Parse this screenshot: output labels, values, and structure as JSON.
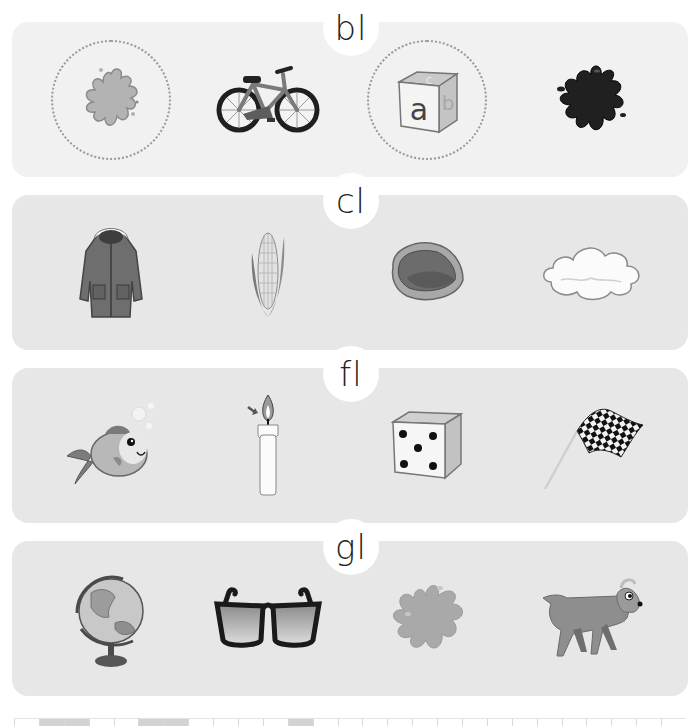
{
  "worksheet": {
    "rows": [
      {
        "blend": "bl",
        "pictures": [
          {
            "name": "blob-splat",
            "icon": "splat-icon",
            "circled": true
          },
          {
            "name": "bike",
            "icon": "bicycle-icon",
            "circled": false
          },
          {
            "name": "block",
            "icon": "letter-block-icon",
            "circled": true,
            "block_letters": [
              "a",
              "b",
              "c"
            ]
          },
          {
            "name": "black splat",
            "icon": "black-splat-icon",
            "circled": false
          }
        ]
      },
      {
        "blend": "cl",
        "pictures": [
          {
            "name": "coat",
            "icon": "coat-icon",
            "circled": false
          },
          {
            "name": "corn",
            "icon": "corn-icon",
            "circled": false
          },
          {
            "name": "clam",
            "icon": "clam-icon",
            "circled": false
          },
          {
            "name": "cloud",
            "icon": "cloud-icon",
            "circled": false
          }
        ]
      },
      {
        "blend": "fl",
        "pictures": [
          {
            "name": "fish",
            "icon": "fish-icon",
            "circled": false
          },
          {
            "name": "flame candle",
            "icon": "candle-flame-icon",
            "circled": false
          },
          {
            "name": "dice",
            "icon": "dice-icon",
            "circled": false,
            "pips": 5
          },
          {
            "name": "flag",
            "icon": "checkered-flag-icon",
            "circled": false
          }
        ]
      },
      {
        "blend": "gl",
        "pictures": [
          {
            "name": "globe",
            "icon": "globe-icon",
            "circled": false
          },
          {
            "name": "glasses",
            "icon": "sunglasses-icon",
            "circled": false
          },
          {
            "name": "glob",
            "icon": "glob-splat-icon",
            "circled": false
          },
          {
            "name": "goat",
            "icon": "goat-icon",
            "circled": false
          }
        ]
      }
    ],
    "bottom_strip": {
      "cells": 27,
      "shaded_cells": [
        1,
        2,
        5,
        6,
        11
      ]
    }
  }
}
